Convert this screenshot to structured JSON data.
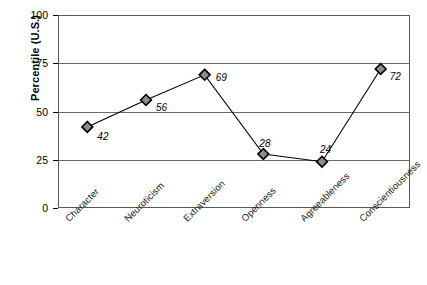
{
  "chart_data": {
    "type": "line",
    "title": "",
    "xlabel": "",
    "ylabel": "Percentile (U.S.)",
    "categories": [
      "Character",
      "Neuroticism",
      "Extraversion",
      "Openness",
      "Agreeableness",
      "Conscientiousness"
    ],
    "values": [
      42,
      56,
      69,
      28,
      24,
      72
    ],
    "point_labels": [
      "42",
      "56",
      "69",
      "28",
      "24",
      "72"
    ],
    "ylim": [
      0,
      100
    ],
    "yticks": [
      0,
      25,
      50,
      75,
      100
    ],
    "ytick_labels": [
      "0",
      "25",
      "50",
      "75",
      "100"
    ],
    "grid": true,
    "grid_axis": "y",
    "legend": "none",
    "series": [
      {
        "name": "Percentile (U.S.)",
        "values": [
          42,
          56,
          69,
          28,
          24,
          72
        ],
        "marker": "diamond",
        "marker_fill": "#8c8c8c",
        "marker_edge": "#000000",
        "line_color": "#000000"
      }
    ],
    "colors": {
      "line": "#000000",
      "marker_fill": "#8c8c8c",
      "marker_edge": "#000000",
      "frame": "#585858",
      "grid": "#6b6b6b",
      "text": "#000000",
      "background": "#ffffff"
    }
  }
}
